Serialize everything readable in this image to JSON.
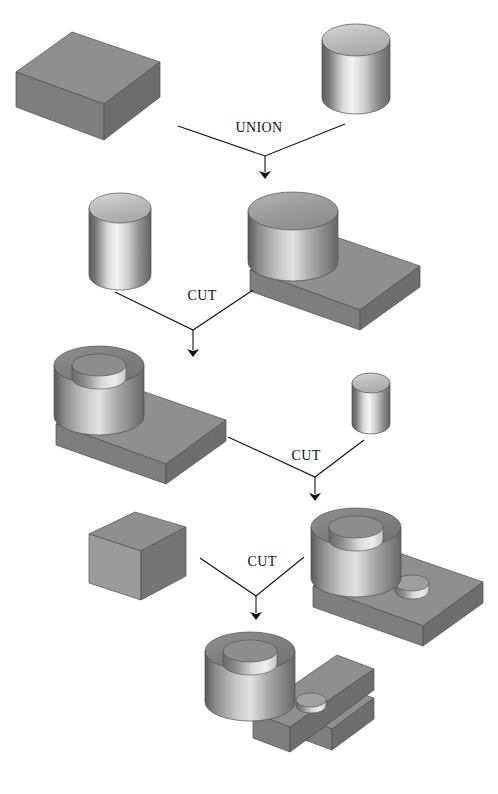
{
  "figure": {
    "background_color": "#ffffff",
    "width": 498,
    "height": 794
  },
  "palette": {
    "solid_dark": "#6f6f6f",
    "solid_mid": "#8a8a8a",
    "solid_light": "#a8a8a8",
    "top_face": "#9a9a9a",
    "front_face": "#8d8d8d",
    "side_face": "#767676",
    "cyl_top": "#9b9b9b",
    "cyl_top_light": "#c9c9c9",
    "highlight": "#f2f2f2",
    "shadow": "#5e5e5e",
    "outline": "#3a3a3a",
    "arrow": "#111111",
    "text": "#111111"
  },
  "operations": [
    {
      "id": "op-union",
      "label": "UNION",
      "x": 259,
      "y": 132
    },
    {
      "id": "op-cut-1",
      "label": "CUT",
      "x": 202,
      "y": 300
    },
    {
      "id": "op-cut-2",
      "label": "CUT",
      "x": 306,
      "y": 460
    },
    {
      "id": "op-cut-3",
      "label": "CUT",
      "x": 262,
      "y": 566
    }
  ],
  "shapes": [
    {
      "id": "shape-block-slab",
      "name": "rectangular-block",
      "row": 1,
      "side": "left",
      "description": "Flat rectangular block (slab) shown in isometric view"
    },
    {
      "id": "shape-cylinder-large",
      "name": "large-cylinder",
      "row": 1,
      "side": "right",
      "description": "Large solid cylinder"
    },
    {
      "id": "shape-cylinder-tool-1",
      "name": "cutting-cylinder-large",
      "row": 2,
      "side": "left",
      "description": "Solid cylinder used as a cutting tool"
    },
    {
      "id": "shape-union-result",
      "name": "boss-on-slab",
      "row": 2,
      "side": "right",
      "description": "Union result: cylindrical boss merged with slab"
    },
    {
      "id": "shape-bored-boss",
      "name": "bored-boss-on-slab",
      "row": 3,
      "side": "left",
      "description": "Cut result: boss with central through hole"
    },
    {
      "id": "shape-cylinder-tool-2",
      "name": "cutting-cylinder-small",
      "row": 3,
      "side": "right",
      "description": "Small cylinder used as a cutting tool"
    },
    {
      "id": "shape-two-holes",
      "name": "bored-boss-with-side-hole",
      "row": 4,
      "side": "right",
      "description": "Cut result: boss with hole plus small hole in slab"
    },
    {
      "id": "shape-block-tool",
      "name": "cutting-block",
      "row": 4,
      "side": "left",
      "description": "Thin upright block used as a cutting tool"
    },
    {
      "id": "shape-final",
      "name": "final-part-with-slot",
      "row": 5,
      "side": "center",
      "description": "Final part: boss with hole and slotted slab"
    }
  ],
  "arrows": [
    {
      "id": "arrow-union",
      "from_left": [
        178,
        126
      ],
      "from_right": [
        345,
        124
      ],
      "joint": [
        265,
        156
      ],
      "tip": [
        265,
        181
      ]
    },
    {
      "id": "arrow-cut-1",
      "from_left": [
        115,
        292
      ],
      "from_right": [
        253,
        290
      ],
      "joint": [
        193,
        330
      ],
      "tip": [
        193,
        359
      ]
    },
    {
      "id": "arrow-cut-2",
      "from_left": [
        228,
        437
      ],
      "from_right": [
        364,
        440
      ],
      "joint": [
        315,
        477
      ],
      "tip": [
        315,
        503
      ]
    },
    {
      "id": "arrow-cut-3",
      "from_left": [
        200,
        558
      ],
      "from_right": [
        304,
        557
      ],
      "joint": [
        256,
        596
      ],
      "tip": [
        256,
        622
      ]
    }
  ]
}
